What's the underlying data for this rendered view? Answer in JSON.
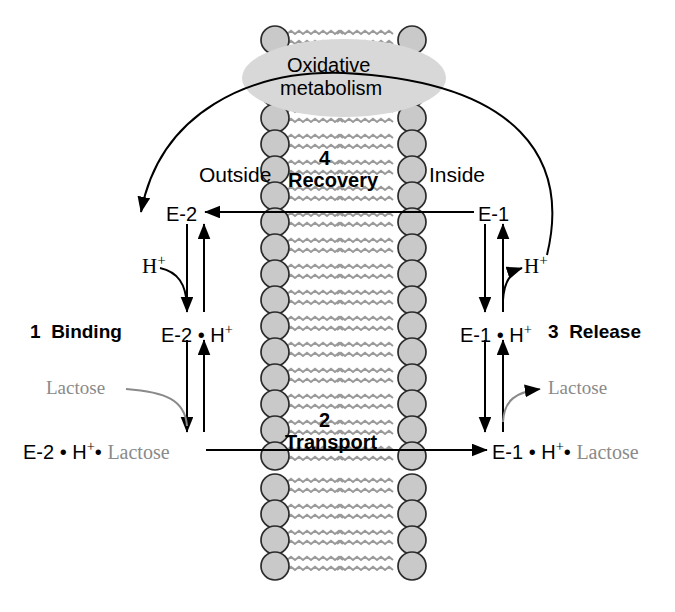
{
  "diagram": {
    "title_region": {
      "oxidative_line1": "Oxidative",
      "oxidative_line2": "metabolism"
    },
    "membrane_labels": {
      "outside": "Outside",
      "inside": "Inside"
    },
    "steps": {
      "step1_number": "1",
      "step1_label": "Binding",
      "step2_number": "2",
      "step2_label": "Transport",
      "step3_number": "3",
      "step3_label": "Release",
      "step4_number": "4",
      "step4_label": "Recovery"
    },
    "species": {
      "e2": "E-2",
      "e1": "E-1",
      "e2_h": "E-2 • H",
      "e1_h": "E-1 • H",
      "h_plus": "H",
      "plus": "+",
      "lactose": "Lactose",
      "e2_h_lactose_prefix": "E-2 • H",
      "e2_h_lactose_mid": "• ",
      "e1_h_lactose_prefix": "E-1 • H",
      "e1_h_lactose_mid": "• "
    },
    "colors": {
      "ink": "#000000",
      "gray_text": "#8a8a8a",
      "lipid_head_fill": "#c9c9c9",
      "lipid_head_stroke": "#2b2b2b",
      "lipid_tail": "#9a9a9a",
      "ellipse_fill": "#d8d8d8",
      "background": "#ffffff"
    }
  }
}
